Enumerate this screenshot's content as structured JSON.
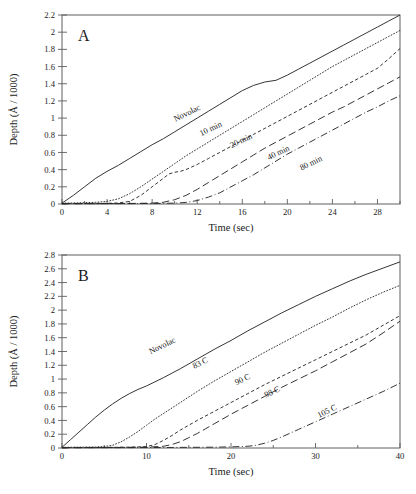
{
  "figure": {
    "background": "#ffffff",
    "ink_color": "#2a2a2a",
    "axis_color": "#5e5e5e"
  },
  "panel_a": {
    "letter": "A",
    "xlabel": "Time (sec)",
    "ylabel": "Depth (Å / 1000)"
  },
  "panel_b": {
    "letter": "B",
    "xlabel": "Time (sec)",
    "ylabel": "Depth (Å / 1000)"
  },
  "chart_data": [
    {
      "id": "panel_a",
      "type": "line",
      "title": "A",
      "xlabel": "Time (sec)",
      "ylabel": "Depth (Å / 1000)",
      "xlim": [
        0,
        30
      ],
      "ylim": [
        0,
        2.2
      ],
      "xticks": [
        0,
        4,
        8,
        12,
        16,
        20,
        24,
        28
      ],
      "xtick_labels": [
        "0",
        "4",
        "8",
        "12",
        "16",
        "20",
        "24",
        "28"
      ],
      "xminor_step": 2,
      "yticks": [
        0,
        0.2,
        0.4,
        0.6,
        0.8,
        1,
        1.2,
        1.4,
        1.6,
        1.8,
        2,
        2.2
      ],
      "ytick_labels": [
        "0",
        "0.2",
        "0.4",
        "0.6",
        "0.8",
        "1",
        "1.2",
        "1.4",
        "1.6",
        "1.8",
        "2",
        "2.2"
      ],
      "grid": false,
      "legend": "inline-curve-labels",
      "series": [
        {
          "name": "Novolac",
          "style": "solid",
          "label_x": 11.2,
          "label_y": 1.03,
          "x": [
            0,
            1,
            2,
            3,
            4,
            5,
            6,
            7,
            8,
            9,
            10,
            11,
            12,
            13,
            14,
            15,
            16,
            17,
            17.5,
            18,
            19,
            20,
            21,
            22,
            23,
            24,
            25,
            26,
            27,
            28,
            29,
            30
          ],
          "y": [
            0.01,
            0.1,
            0.2,
            0.3,
            0.38,
            0.45,
            0.53,
            0.61,
            0.69,
            0.76,
            0.84,
            0.92,
            1.0,
            1.08,
            1.16,
            1.24,
            1.32,
            1.38,
            1.4,
            1.42,
            1.44,
            1.5,
            1.57,
            1.64,
            1.71,
            1.78,
            1.85,
            1.92,
            1.99,
            2.06,
            2.13,
            2.2
          ]
        },
        {
          "name": "10 min",
          "style": "dotted",
          "label_x": 13.3,
          "label_y": 0.85,
          "x": [
            0,
            1,
            2,
            3,
            4,
            5,
            6,
            7,
            8,
            9,
            10,
            11,
            12,
            13,
            14,
            15,
            16,
            17,
            18,
            19,
            20,
            21,
            22,
            23,
            24,
            25,
            26,
            27,
            28,
            29,
            30
          ],
          "y": [
            0.01,
            0.012,
            0.015,
            0.02,
            0.03,
            0.06,
            0.12,
            0.2,
            0.29,
            0.38,
            0.47,
            0.56,
            0.64,
            0.72,
            0.8,
            0.88,
            0.96,
            1.04,
            1.12,
            1.2,
            1.28,
            1.36,
            1.44,
            1.52,
            1.6,
            1.67,
            1.74,
            1.81,
            1.88,
            1.95,
            2.02
          ]
        },
        {
          "name": "20 min",
          "style": "dashed",
          "label_x": 16.0,
          "label_y": 0.71,
          "x": [
            0,
            2,
            4,
            5,
            6,
            7,
            8,
            9,
            9.5,
            10,
            10.5,
            11,
            12,
            13,
            14,
            15,
            16,
            17,
            18,
            19,
            20,
            21,
            22,
            23,
            24,
            25,
            26,
            27,
            28,
            29,
            30
          ],
          "y": [
            0.005,
            0.006,
            0.008,
            0.012,
            0.03,
            0.1,
            0.2,
            0.3,
            0.35,
            0.37,
            0.38,
            0.4,
            0.46,
            0.53,
            0.6,
            0.67,
            0.74,
            0.81,
            0.88,
            0.95,
            1.02,
            1.09,
            1.16,
            1.23,
            1.3,
            1.37,
            1.44,
            1.51,
            1.58,
            1.69,
            1.81
          ]
        },
        {
          "name": "40 min",
          "style": "longdash",
          "label_x": 19.3,
          "label_y": 0.57,
          "x": [
            0,
            3,
            6,
            8,
            9,
            10,
            11,
            12,
            13,
            14,
            15,
            16,
            17,
            18,
            19,
            20,
            21,
            22,
            23,
            24,
            25,
            26,
            27,
            28,
            29,
            30
          ],
          "y": [
            0.004,
            0.005,
            0.006,
            0.01,
            0.02,
            0.05,
            0.1,
            0.17,
            0.25,
            0.33,
            0.41,
            0.49,
            0.57,
            0.65,
            0.72,
            0.79,
            0.86,
            0.93,
            1.0,
            1.07,
            1.13,
            1.2,
            1.27,
            1.34,
            1.41,
            1.48
          ]
        },
        {
          "name": "80 min",
          "style": "dashdot",
          "label_x": 22.2,
          "label_y": 0.45,
          "x": [
            0,
            4,
            8,
            10,
            11,
            12,
            13,
            14,
            15,
            16,
            17,
            18,
            19,
            20,
            21,
            22,
            23,
            24,
            25,
            26,
            27,
            28,
            29,
            30
          ],
          "y": [
            0.003,
            0.004,
            0.006,
            0.01,
            0.018,
            0.04,
            0.08,
            0.13,
            0.2,
            0.27,
            0.34,
            0.42,
            0.5,
            0.58,
            0.65,
            0.72,
            0.79,
            0.86,
            0.93,
            1.0,
            1.07,
            1.13,
            1.2,
            1.26
          ]
        }
      ]
    },
    {
      "id": "panel_b",
      "type": "line",
      "title": "B",
      "xlabel": "Time (sec)",
      "ylabel": "Depth (Å / 1000)",
      "xlim": [
        0,
        40
      ],
      "ylim": [
        0,
        2.8
      ],
      "xticks": [
        0,
        10,
        20,
        30,
        40
      ],
      "xtick_labels": [
        "0",
        "10",
        "20",
        "30",
        "40"
      ],
      "xminor_step": 5,
      "yticks": [
        0,
        0.2,
        0.4,
        0.6,
        0.8,
        1,
        1.2,
        1.4,
        1.6,
        1.8,
        2,
        2.2,
        2.4,
        2.6,
        2.8
      ],
      "ytick_labels": [
        "0",
        "0.2",
        "0.4",
        "0.6",
        "0.8",
        "1",
        "1.2",
        "1.4",
        "1.6",
        "1.8",
        "2",
        "2.2",
        "2.4",
        "2.6",
        "2.8"
      ],
      "grid": false,
      "legend": "inline-curve-labels",
      "series": [
        {
          "name": "Novolac",
          "style": "solid",
          "label_x": 12.0,
          "label_y": 1.45,
          "x": [
            0,
            1,
            2,
            3,
            4,
            5,
            6,
            7,
            8,
            9,
            10,
            12,
            14,
            16,
            18,
            20,
            22,
            24,
            26,
            28,
            30,
            32,
            34,
            36,
            38,
            40
          ],
          "y": [
            0.01,
            0.12,
            0.23,
            0.34,
            0.45,
            0.55,
            0.64,
            0.72,
            0.79,
            0.85,
            0.9,
            1.02,
            1.15,
            1.29,
            1.43,
            1.56,
            1.7,
            1.83,
            1.96,
            2.08,
            2.2,
            2.31,
            2.42,
            2.52,
            2.61,
            2.7
          ]
        },
        {
          "name": "83 C",
          "style": "dotted",
          "label_x": 16.5,
          "label_y": 1.2,
          "x": [
            0,
            2,
            4,
            5,
            6,
            7,
            8,
            9,
            10,
            11,
            12,
            14,
            16,
            18,
            20,
            22,
            24,
            26,
            28,
            30,
            32,
            34,
            36,
            38,
            40
          ],
          "y": [
            0.01,
            0.012,
            0.015,
            0.02,
            0.04,
            0.09,
            0.16,
            0.24,
            0.33,
            0.42,
            0.5,
            0.66,
            0.82,
            0.97,
            1.11,
            1.25,
            1.39,
            1.52,
            1.65,
            1.78,
            1.9,
            2.03,
            2.15,
            2.26,
            2.36
          ]
        },
        {
          "name": "90 C",
          "style": "dashed",
          "label_x": 21.5,
          "label_y": 0.96,
          "x": [
            0,
            4,
            8,
            10,
            11,
            12,
            13,
            14,
            15,
            16,
            18,
            20,
            22,
            24,
            26,
            28,
            30,
            32,
            34,
            36,
            38,
            40
          ],
          "y": [
            0.006,
            0.008,
            0.012,
            0.02,
            0.05,
            0.11,
            0.18,
            0.26,
            0.33,
            0.4,
            0.53,
            0.66,
            0.79,
            0.92,
            1.04,
            1.16,
            1.28,
            1.4,
            1.52,
            1.64,
            1.78,
            1.92
          ]
        },
        {
          "name": "98 C",
          "style": "longdash",
          "label_x": 25.0,
          "label_y": 0.78,
          "x": [
            0,
            5,
            10,
            12,
            13,
            14,
            15,
            16,
            17,
            18,
            20,
            22,
            24,
            26,
            28,
            30,
            32,
            34,
            36,
            38,
            40
          ],
          "y": [
            0.005,
            0.007,
            0.012,
            0.025,
            0.05,
            0.09,
            0.15,
            0.21,
            0.28,
            0.35,
            0.49,
            0.62,
            0.75,
            0.88,
            1.0,
            1.12,
            1.25,
            1.38,
            1.51,
            1.67,
            1.84
          ]
        },
        {
          "name": "105 C",
          "style": "dashdot",
          "label_x": 31.5,
          "label_y": 0.5,
          "x": [
            0,
            6,
            12,
            18,
            20,
            22,
            23,
            24,
            25,
            26,
            28,
            30,
            32,
            34,
            36,
            38,
            40
          ],
          "y": [
            0.004,
            0.005,
            0.007,
            0.012,
            0.016,
            0.025,
            0.04,
            0.07,
            0.11,
            0.16,
            0.27,
            0.38,
            0.49,
            0.6,
            0.71,
            0.82,
            0.94
          ]
        }
      ]
    }
  ]
}
